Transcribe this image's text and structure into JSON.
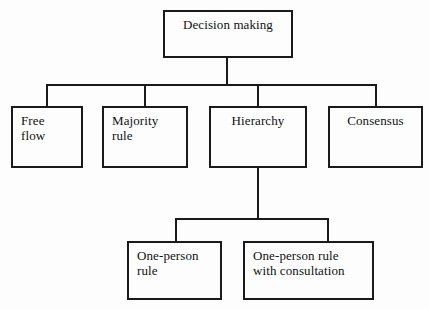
{
  "diagram": {
    "title": "Decision making",
    "type": "hierarchical-tree",
    "background_color": "#fdfdfd",
    "line_color": "#1a1a1a",
    "text_color": "#111111",
    "levels": 3,
    "nodes": [
      {
        "id": "decision-making",
        "label": "Decision making",
        "level": 0,
        "x": 163,
        "y": 10,
        "w": 130,
        "h": 48
      },
      {
        "id": "free-flow",
        "label": "Free\nflow",
        "level": 1,
        "x": 11,
        "y": 106,
        "w": 72,
        "h": 62
      },
      {
        "id": "majority-rule",
        "label": "Majority\nrule",
        "level": 1,
        "x": 102,
        "y": 106,
        "w": 86,
        "h": 62
      },
      {
        "id": "hierarchy",
        "label": "Hierarchy",
        "level": 1,
        "x": 209,
        "y": 106,
        "w": 98,
        "h": 62
      },
      {
        "id": "consensus",
        "label": "Consensus",
        "level": 1,
        "x": 328,
        "y": 106,
        "w": 95,
        "h": 62
      },
      {
        "id": "one-person-rule",
        "label": "One-person\nrule",
        "level": 2,
        "x": 127,
        "y": 241,
        "w": 95,
        "h": 59
      },
      {
        "id": "one-person-rule-with-consultation",
        "label": "One-person rule\nwith consultation",
        "level": 2,
        "x": 243,
        "y": 241,
        "w": 131,
        "h": 59
      }
    ],
    "edges": [
      {
        "from": "decision-making",
        "to": "free-flow"
      },
      {
        "from": "decision-making",
        "to": "majority-rule"
      },
      {
        "from": "decision-making",
        "to": "hierarchy"
      },
      {
        "from": "decision-making",
        "to": "consensus"
      },
      {
        "from": "hierarchy",
        "to": "one-person-rule"
      },
      {
        "from": "hierarchy",
        "to": "one-person-rule-with-consultation"
      }
    ]
  }
}
